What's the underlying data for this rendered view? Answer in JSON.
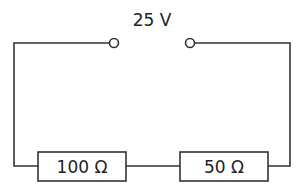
{
  "diagram": {
    "type": "circuit",
    "source": {
      "label": "25 V"
    },
    "resistors": [
      {
        "label": "100 Ω"
      },
      {
        "label": "50 Ω"
      }
    ],
    "stroke_color": "#333333"
  }
}
